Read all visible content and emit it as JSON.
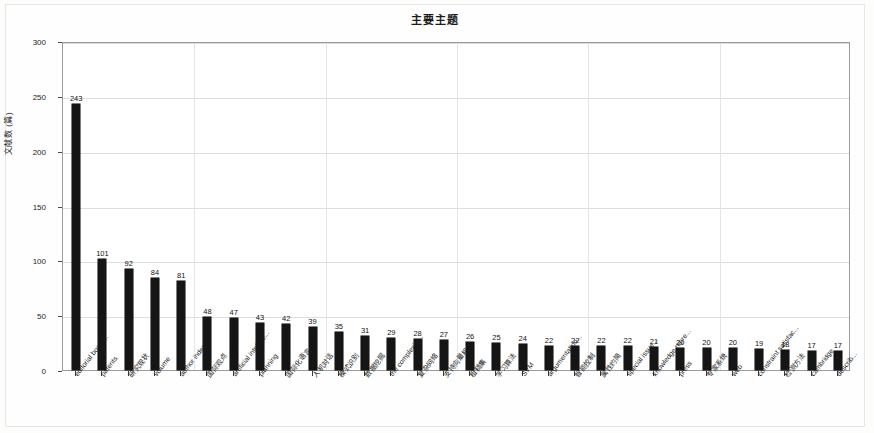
{
  "chart_data": {
    "type": "bar",
    "title": "主要主题",
    "xlabel": "",
    "ylabel": "文献数 (篇)",
    "ylim": [
      0,
      300
    ],
    "ytick_labels": [
      "0",
      "50",
      "100",
      "150",
      "200",
      "250",
      "300"
    ],
    "ytick_values": [
      0,
      50,
      100,
      150,
      200,
      250,
      300
    ],
    "grid": true,
    "legend": null,
    "categories": [
      "editorial board...",
      "patents",
      "研究现状",
      "volume",
      "author index...",
      "国际观点",
      "artificial intellige...",
      "planning",
      "国际化语言",
      "人机对话",
      "模式识别",
      "数据挖掘",
      "the complexity...",
      "复杂网络",
      "支持向量机",
      "粗糙集",
      "学习算法",
      "SVM",
      "argumentation...",
      "智能控制",
      "属性约简",
      "special issue...",
      "knowledge repre...",
      "press",
      "专家系统",
      "web",
      "constraint satisfac...",
      "检测方法",
      "cambridge",
      "describ..."
    ],
    "values": [
      243,
      101,
      92,
      84,
      81,
      48,
      47,
      43,
      42,
      39,
      35,
      31,
      29,
      28,
      27,
      26,
      25,
      24,
      22,
      22,
      22,
      22,
      21,
      20,
      20,
      20,
      19,
      18,
      17,
      17
    ],
    "value_labels": [
      "243",
      "101",
      "92",
      "84",
      "81",
      "48",
      "47",
      "43",
      "42",
      "39",
      "35",
      "31",
      "29",
      "28",
      "27",
      "26",
      "25",
      "24",
      "22",
      "22",
      "22",
      "22",
      "21",
      "20",
      "20",
      "20",
      "19",
      "18",
      "17",
      "17"
    ],
    "bar_color": "#151515",
    "plot_border_color": "#9a9a98",
    "grid_color": "#dedede",
    "background_color": "#ffffff"
  }
}
